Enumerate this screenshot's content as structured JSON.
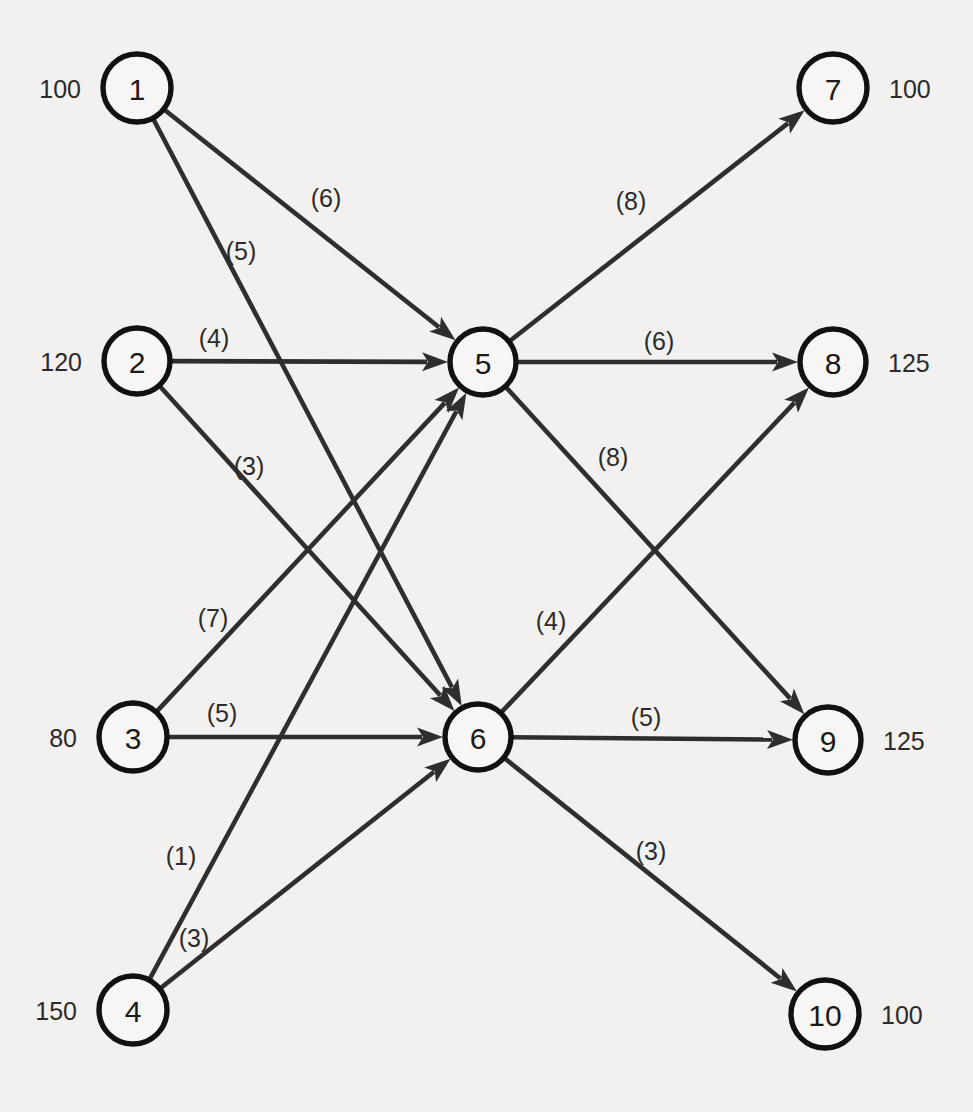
{
  "chart_data": {
    "type": "diagram",
    "nodes": [
      {
        "id": "1",
        "label": "1",
        "amount": "100",
        "amount_side": "left",
        "x": 137,
        "y": 88,
        "r": 34,
        "role": "source"
      },
      {
        "id": "2",
        "label": "2",
        "amount": "120",
        "amount_side": "left",
        "x": 137,
        "y": 361,
        "r": 33,
        "role": "source"
      },
      {
        "id": "3",
        "label": "3",
        "amount": "80",
        "amount_side": "left",
        "x": 133,
        "y": 737,
        "r": 34,
        "role": "source"
      },
      {
        "id": "4",
        "label": "4",
        "amount": "150",
        "amount_side": "left",
        "x": 133,
        "y": 1010,
        "r": 34,
        "role": "source"
      },
      {
        "id": "5",
        "label": "5",
        "amount": "",
        "amount_side": "none",
        "x": 483,
        "y": 362,
        "r": 33,
        "role": "transshipment"
      },
      {
        "id": "6",
        "label": "6",
        "amount": "",
        "amount_side": "none",
        "x": 478,
        "y": 737,
        "r": 33,
        "role": "transshipment"
      },
      {
        "id": "7",
        "label": "7",
        "amount": "100",
        "amount_side": "right",
        "x": 833,
        "y": 88,
        "r": 34,
        "role": "sink"
      },
      {
        "id": "8",
        "label": "8",
        "amount": "125",
        "amount_side": "right",
        "x": 833,
        "y": 362,
        "r": 33,
        "role": "sink"
      },
      {
        "id": "9",
        "label": "9",
        "amount": "125",
        "amount_side": "right",
        "x": 828,
        "y": 740,
        "r": 33,
        "role": "sink"
      },
      {
        "id": "10",
        "label": "10",
        "amount": "100",
        "amount_side": "right",
        "x": 825,
        "y": 1014,
        "r": 34,
        "role": "sink"
      }
    ],
    "edges": [
      {
        "from": "1",
        "to": "5",
        "cost": "(6)",
        "label_x": 326,
        "label_y": 198
      },
      {
        "from": "1",
        "to": "6",
        "cost": "(5)",
        "label_x": 241,
        "label_y": 251
      },
      {
        "from": "2",
        "to": "5",
        "cost": "(4)",
        "label_x": 214,
        "label_y": 338
      },
      {
        "from": "2",
        "to": "6",
        "cost": "(3)",
        "label_x": 249,
        "label_y": 466
      },
      {
        "from": "3",
        "to": "5",
        "cost": "(7)",
        "label_x": 213,
        "label_y": 618
      },
      {
        "from": "3",
        "to": "6",
        "cost": "(5)",
        "label_x": 222,
        "label_y": 713
      },
      {
        "from": "4",
        "to": "5",
        "cost": "(1)",
        "label_x": 181,
        "label_y": 856
      },
      {
        "from": "4",
        "to": "6",
        "cost": "(3)",
        "label_x": 194,
        "label_y": 938
      },
      {
        "from": "5",
        "to": "7",
        "cost": "(8)",
        "label_x": 631,
        "label_y": 201
      },
      {
        "from": "5",
        "to": "8",
        "cost": "(6)",
        "label_x": 659,
        "label_y": 341
      },
      {
        "from": "5",
        "to": "9",
        "cost": "(8)",
        "label_x": 613,
        "label_y": 457
      },
      {
        "from": "6",
        "to": "8",
        "cost": "(4)",
        "label_x": 551,
        "label_y": 621
      },
      {
        "from": "6",
        "to": "9",
        "cost": "(5)",
        "label_x": 646,
        "label_y": 717
      },
      {
        "from": "6",
        "to": "10",
        "cost": "(3)",
        "label_x": 651,
        "label_y": 851
      }
    ],
    "colors": {
      "background": "#f2f1ef",
      "edge": "#2e2e2e",
      "node_stroke": "#111111",
      "node_fill": "#f7f6f4",
      "text": "#1a1a1a"
    }
  }
}
